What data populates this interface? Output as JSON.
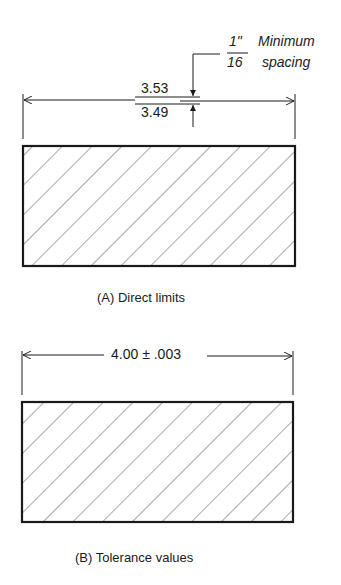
{
  "figure_a": {
    "upper_limit": "3.53",
    "lower_limit": "3.49",
    "fraction_numerator": "1\"",
    "fraction_denominator": "16",
    "note_line1": "Minimum",
    "note_line2": "spacing",
    "caption": "(A) Direct limits"
  },
  "figure_b": {
    "dimension": "4.00 ± .003",
    "caption": "(B) Tolerance values"
  },
  "colors": {
    "line": "#1a1a1a",
    "hatch": "#555555",
    "background": "#ffffff"
  }
}
